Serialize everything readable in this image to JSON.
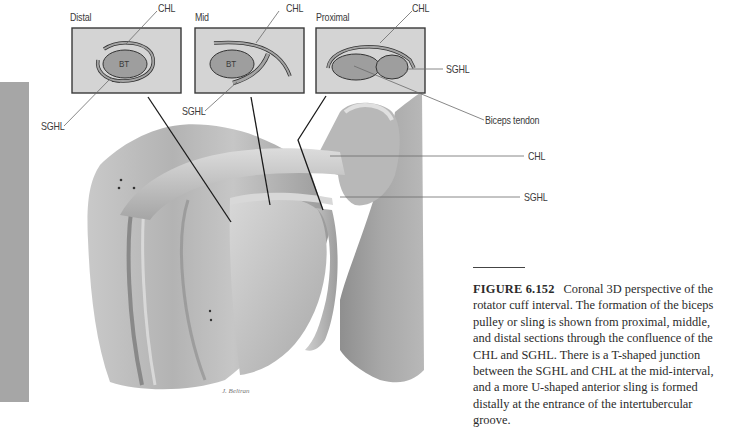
{
  "figure": {
    "panels": [
      {
        "id": "distal",
        "title": "Distal",
        "center_label": "BT",
        "callouts": [
          "CHL",
          "SGHL"
        ]
      },
      {
        "id": "mid",
        "title": "Mid",
        "center_label": "BT",
        "callouts": [
          "CHL",
          "SGHL"
        ]
      },
      {
        "id": "proximal",
        "title": "Proximal",
        "callouts": [
          "CHL",
          "SGHL",
          "Biceps tendon"
        ]
      }
    ],
    "anatomy_callouts": {
      "chl": "CHL",
      "sghl": "SGHL"
    },
    "signature": "J. Beltran",
    "colors": {
      "panel_fill": "#d4d4d4",
      "panel_border": "#3a3a3a",
      "structure_fill": "#9e9e9e",
      "sidebar_bar": "#a6a6a6",
      "bone_base": "#bdbdbd"
    }
  },
  "caption": {
    "figure_number": "FIGURE 6.152",
    "text": "Coronal 3D perspective of the rotator cuff interval. The formation of the biceps pulley or sling is shown from proximal, middle, and distal sections through the confluence of the CHL and SGHL. There is a T-shaped junction between the SGHL and CHL at the mid-interval, and a more U-shaped anterior sling is formed distally at the entrance of the intertubercular groove."
  }
}
